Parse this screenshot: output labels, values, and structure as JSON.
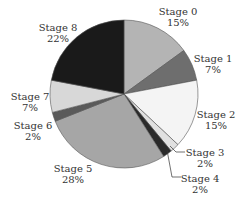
{
  "chart_data": {
    "type": "pie",
    "title": "",
    "start_angle_deg": 0,
    "direction": "clockwise",
    "slices": [
      {
        "label": "Stage 0",
        "value": 15,
        "display": "15%",
        "color": "#b4b4b4"
      },
      {
        "label": "Stage 1",
        "value": 7,
        "display": "7%",
        "color": "#6e6e6e"
      },
      {
        "label": "Stage 2",
        "value": 15,
        "display": "15%",
        "color": "#f4f4f4"
      },
      {
        "label": "Stage 3",
        "value": 2,
        "display": "2%",
        "color": "#e0e0e0"
      },
      {
        "label": "Stage 4",
        "value": 2,
        "display": "2%",
        "color": "#2a2a2a"
      },
      {
        "label": "Stage 5",
        "value": 28,
        "display": "28%",
        "color": "#a6a6a6"
      },
      {
        "label": "Stage 6",
        "value": 2,
        "display": "2%",
        "color": "#5a5a5a"
      },
      {
        "label": "Stage 7",
        "value": 7,
        "display": "7%",
        "color": "#d8d8d8"
      },
      {
        "label": "Stage 8",
        "value": 22,
        "display": "22%",
        "color": "#1a1a1a"
      }
    ],
    "legend": "none",
    "labels_position": "outside"
  },
  "labels": [
    {
      "name": "Stage 0",
      "pct": "15%",
      "x": 178,
      "y": 6
    },
    {
      "name": "Stage 1",
      "pct": "7%",
      "x": 213,
      "y": 53
    },
    {
      "name": "Stage 2",
      "pct": "15%",
      "x": 216,
      "y": 109
    },
    {
      "name": "Stage 3",
      "pct": "2%",
      "x": 205,
      "y": 147
    },
    {
      "name": "Stage 4",
      "pct": "2%",
      "x": 200,
      "y": 173
    },
    {
      "name": "Stage 5",
      "pct": "28%",
      "x": 73,
      "y": 163
    },
    {
      "name": "Stage 6",
      "pct": "2%",
      "x": 33,
      "y": 120
    },
    {
      "name": "Stage 7",
      "pct": "7%",
      "x": 30,
      "y": 91
    },
    {
      "name": "Stage 8",
      "pct": "22%",
      "x": 58,
      "y": 22
    }
  ]
}
